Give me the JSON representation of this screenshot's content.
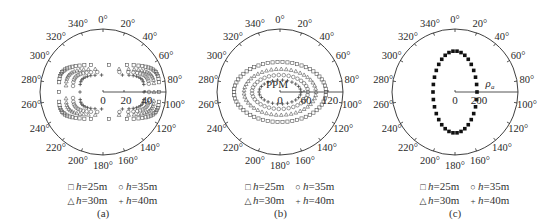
{
  "chart_data": [
    {
      "type": "scatter",
      "subtype": "polar",
      "panel_label": "(a)",
      "angle_ticks": [
        "0°",
        "20°",
        "40°",
        "60°",
        "80°",
        "100°",
        "120°",
        "140°",
        "160°",
        "180°",
        "200°",
        "220°",
        "240°",
        "260°",
        "280°",
        "300°",
        "320°",
        "340°"
      ],
      "radial_axis": {
        "tick_labels": [
          "0",
          "20",
          "40"
        ],
        "direction_deg": 90
      },
      "legend": [
        {
          "marker": "square",
          "label": "h=25m"
        },
        {
          "marker": "circle",
          "label": "h=35m"
        },
        {
          "marker": "triangle",
          "label": "h=30m"
        },
        {
          "marker": "plus",
          "label": "h=40m"
        }
      ],
      "series": [
        {
          "name": "h=25m",
          "marker": "square",
          "shape": "stadium",
          "center_offset_px": [
            6,
            0
          ],
          "half_width_px": 50,
          "half_height_px": 27
        },
        {
          "name": "h=30m",
          "marker": "triangle",
          "shape": "stadium",
          "center_offset_px": [
            7,
            0
          ],
          "half_width_px": 44,
          "half_height_px": 23
        },
        {
          "name": "h=35m",
          "marker": "circle",
          "shape": "stadium",
          "center_offset_px": [
            8,
            0
          ],
          "half_width_px": 38,
          "half_height_px": 20
        },
        {
          "name": "h=40m",
          "marker": "plus",
          "shape": "stadium",
          "center_offset_px": [
            9,
            0
          ],
          "half_width_px": 32,
          "half_height_px": 17
        }
      ]
    },
    {
      "type": "scatter",
      "subtype": "polar",
      "panel_label": "(b)",
      "angle_ticks": [
        "0°",
        "20°",
        "40°",
        "60°",
        "80°",
        "100°",
        "120°",
        "140°",
        "160°",
        "180°",
        "200°",
        "220°",
        "240°",
        "260°",
        "280°",
        "300°",
        "320°",
        "340°"
      ],
      "radial_axis": {
        "tick_labels": [
          "0",
          "60",
          "120"
        ],
        "direction_deg": 90,
        "unit_label": "PPM"
      },
      "legend": [
        {
          "marker": "square",
          "label": "h=25m"
        },
        {
          "marker": "circle",
          "label": "h=35m"
        },
        {
          "marker": "triangle",
          "label": "h=30m"
        },
        {
          "marker": "plus",
          "label": "h=40m"
        }
      ],
      "series": [
        {
          "name": "h=25m",
          "marker": "square",
          "shape": "ellipse",
          "center_offset_px": [
            0,
            0
          ],
          "half_width_px": 46,
          "half_height_px": 30
        },
        {
          "name": "h=30m",
          "marker": "triangle",
          "shape": "ellipse",
          "center_offset_px": [
            0,
            0
          ],
          "half_width_px": 36,
          "half_height_px": 23
        },
        {
          "name": "h=35m",
          "marker": "circle",
          "shape": "ellipse",
          "center_offset_px": [
            0,
            0
          ],
          "half_width_px": 28,
          "half_height_px": 17
        },
        {
          "name": "h=40m",
          "marker": "plus",
          "shape": "ellipse",
          "center_offset_px": [
            0,
            0
          ],
          "half_width_px": 21,
          "half_height_px": 12
        }
      ]
    },
    {
      "type": "scatter",
      "subtype": "polar",
      "panel_label": "(c)",
      "angle_ticks": [
        "0°",
        "20°",
        "40°",
        "60°",
        "80°",
        "100°",
        "120°",
        "140°",
        "160°",
        "180°",
        "200°",
        "220°",
        "240°",
        "260°",
        "280°",
        "300°",
        "320°",
        "340°"
      ],
      "radial_axis": {
        "tick_labels": [
          "0",
          "200"
        ],
        "direction_deg": 90,
        "unit_label": "ρa"
      },
      "legend": [
        {
          "marker": "square",
          "label": "h=25m"
        },
        {
          "marker": "circle",
          "label": "h=35m"
        },
        {
          "marker": "triangle",
          "label": "h=30m"
        },
        {
          "marker": "plus",
          "label": "h=40m"
        }
      ],
      "series": [
        {
          "name": "all heights (overlapping)",
          "marker": "filled-square",
          "shape": "ellipse",
          "center_offset_px": [
            0,
            0
          ],
          "half_width_px": 22,
          "half_height_px": 41
        }
      ]
    }
  ],
  "panels": [
    {
      "caption": "(a)",
      "legend_rows": [
        [
          {
            "sym": "□",
            "h": "h",
            "val": "=25m"
          },
          {
            "sym": "○",
            "h": "h",
            "val": "=35m"
          }
        ],
        [
          {
            "sym": "△",
            "h": "h",
            "val": "=30m"
          },
          {
            "sym": "+",
            "h": "h",
            "val": "=40m"
          }
        ]
      ]
    },
    {
      "caption": "(b)",
      "legend_rows": [
        [
          {
            "sym": "□",
            "h": "h",
            "val": "=25m"
          },
          {
            "sym": "○",
            "h": "h",
            "val": "=35m"
          }
        ],
        [
          {
            "sym": "△",
            "h": "h",
            "val": "=30m"
          },
          {
            "sym": "+",
            "h": "h",
            "val": "=40m"
          }
        ]
      ]
    },
    {
      "caption": "(c)",
      "legend_rows": [
        [
          {
            "sym": "□",
            "h": "h",
            "val": "=25m"
          },
          {
            "sym": "○",
            "h": "h",
            "val": "=35m"
          }
        ],
        [
          {
            "sym": "△",
            "h": "h",
            "val": "=30m"
          },
          {
            "sym": "+",
            "h": "h",
            "val": "=40m"
          }
        ]
      ]
    }
  ],
  "colors": {
    "ink": "#2a2a2a",
    "marker": "#555555",
    "filled_marker": "#111111",
    "background": "#ffffff"
  }
}
